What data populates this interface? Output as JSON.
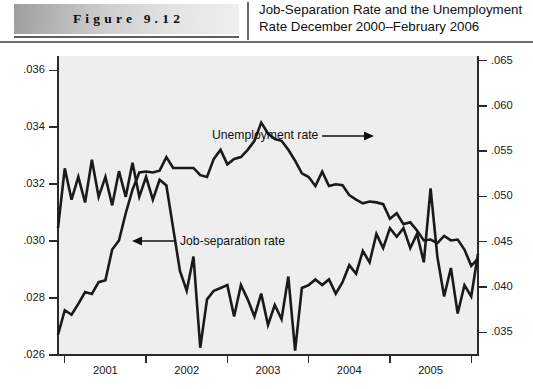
{
  "header": {
    "figure_label": "Figure 9.12",
    "title_line1": "Job-Separation Rate and the Unemployment",
    "title_line2": "Rate December 2000–February 2006"
  },
  "annotations": {
    "unemployment": "Unemployment rate",
    "job_separation": "Job-separation rate"
  },
  "colors": {
    "line": "#1a1a1a",
    "plot_background": "#eeeeee",
    "axis": "#2a2a2a",
    "banner_dark": "#9d9d9d",
    "banner_light": "#efefef"
  },
  "chart_data": {
    "type": "line",
    "title": "Job-Separation Rate and the Unemployment Rate December 2000–February 2006",
    "xlabel": "",
    "ylabel": "Job-separation rate",
    "y2label": "Unemployment rate",
    "grid": false,
    "legend": "annotated-inline",
    "xlim": [
      "2000-12",
      "2006-02"
    ],
    "x_tick_labels": [
      "2001",
      "2002",
      "2003",
      "2004",
      "2005"
    ],
    "x_tick_years": [
      2001,
      2002,
      2003,
      2004,
      2005,
      2006
    ],
    "ylim": [
      0.026,
      0.0365
    ],
    "y_tick_labels": [
      ".026",
      ".028",
      ".030",
      ".032",
      ".034",
      ".036"
    ],
    "y_ticks": [
      0.026,
      0.028,
      0.03,
      0.032,
      0.034,
      0.036
    ],
    "y2lim": [
      0.0325,
      0.0655
    ],
    "y2_tick_labels": [
      ".035",
      ".040",
      ".045",
      ".050",
      ".055",
      ".060",
      ".065"
    ],
    "y2_ticks": [
      0.035,
      0.04,
      0.045,
      0.05,
      0.055,
      0.06,
      0.065
    ],
    "x": [
      "2000-12",
      "2001-01",
      "2001-02",
      "2001-03",
      "2001-04",
      "2001-05",
      "2001-06",
      "2001-07",
      "2001-08",
      "2001-09",
      "2001-10",
      "2001-11",
      "2001-12",
      "2002-01",
      "2002-02",
      "2002-03",
      "2002-04",
      "2002-05",
      "2002-06",
      "2002-07",
      "2002-08",
      "2002-09",
      "2002-10",
      "2002-11",
      "2002-12",
      "2003-01",
      "2003-02",
      "2003-03",
      "2003-04",
      "2003-05",
      "2003-06",
      "2003-07",
      "2003-08",
      "2003-09",
      "2003-10",
      "2003-11",
      "2003-12",
      "2004-01",
      "2004-02",
      "2004-03",
      "2004-04",
      "2004-05",
      "2004-06",
      "2004-07",
      "2004-08",
      "2004-09",
      "2004-10",
      "2004-11",
      "2004-12",
      "2005-01",
      "2005-02",
      "2005-03",
      "2005-04",
      "2005-05",
      "2005-06",
      "2005-07",
      "2005-08",
      "2005-09",
      "2005-10",
      "2005-11",
      "2005-12",
      "2006-01",
      "2006-02"
    ],
    "series": [
      {
        "name": "Job-separation rate",
        "axis": "left",
        "values": [
          0.032,
          0.0341,
          0.033,
          0.0338,
          0.0329,
          0.0344,
          0.0331,
          0.0338,
          0.0328,
          0.034,
          0.0331,
          0.0343,
          0.0331,
          0.0338,
          0.033,
          0.0337,
          0.0335,
          0.032,
          0.0305,
          0.0298,
          0.031,
          0.0278,
          0.0295,
          0.0298,
          0.0299,
          0.03,
          0.0289,
          0.03,
          0.0295,
          0.0289,
          0.0297,
          0.0286,
          0.0293,
          0.0288,
          0.0303,
          0.0277,
          0.0299,
          0.03,
          0.0302,
          0.03,
          0.0302,
          0.0297,
          0.0301,
          0.0307,
          0.0304,
          0.0312,
          0.0308,
          0.0318,
          0.0313,
          0.032,
          0.0317,
          0.032,
          0.0313,
          0.0318,
          0.0308,
          0.0334,
          0.031,
          0.0296,
          0.0306,
          0.029,
          0.03,
          0.0296,
          0.0311
        ]
      },
      {
        "name": "Unemployment rate",
        "axis": "right",
        "values": [
          0.0396,
          0.0423,
          0.0418,
          0.043,
          0.0443,
          0.0441,
          0.0454,
          0.0456,
          0.049,
          0.05,
          0.053,
          0.0556,
          0.0575,
          0.0576,
          0.0575,
          0.0577,
          0.0592,
          0.058,
          0.058,
          0.058,
          0.058,
          0.0572,
          0.057,
          0.059,
          0.06,
          0.0584,
          0.059,
          0.0592,
          0.06,
          0.061,
          0.063,
          0.0618,
          0.0612,
          0.061,
          0.06,
          0.0588,
          0.0574,
          0.057,
          0.056,
          0.0576,
          0.056,
          0.0562,
          0.0561,
          0.055,
          0.0545,
          0.0541,
          0.0543,
          0.0542,
          0.054,
          0.0524,
          0.053,
          0.0518,
          0.052,
          0.0511,
          0.05,
          0.0501,
          0.0497,
          0.0505,
          0.05,
          0.0501,
          0.049,
          0.0472,
          0.048
        ]
      }
    ]
  }
}
